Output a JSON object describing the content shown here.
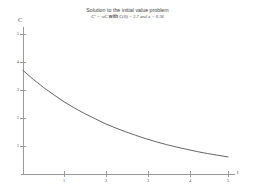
{
  "title": {
    "line1": "Solution to the initial value problem",
    "line2_math_pre": "C' = -aC",
    "line2_with": "with",
    "line2_math_post": "C(0) = 3.7 and a = 0.36"
  },
  "chart_data": {
    "type": "line",
    "title": "Solution to the initial value problem",
    "subtitle": "C' = -aC with C(0) = 3.7 and a = 0.36",
    "xlabel": "t",
    "ylabel": "C",
    "xlim": [
      0,
      5.2
    ],
    "ylim": [
      0,
      5
    ],
    "grid": false,
    "legend": "none",
    "xticks": [
      1,
      2,
      3,
      4,
      5
    ],
    "xtick_labels": [
      "1",
      "2",
      "3",
      "4",
      "5"
    ],
    "yticks": [
      1,
      2,
      3,
      4,
      5
    ],
    "ytick_labels": [
      "1",
      "2",
      "3",
      "4",
      "5"
    ],
    "series": [
      {
        "name": "C(t) = 3.7 e^(-0.36 t)",
        "color": "#555555",
        "x": [
          0,
          0.25,
          0.5,
          0.75,
          1,
          1.25,
          1.5,
          1.75,
          2,
          2.25,
          2.5,
          2.75,
          3,
          3.25,
          3.5,
          3.75,
          4,
          4.25,
          4.5,
          4.75,
          5
        ],
        "y": [
          3.7,
          3.38,
          3.09,
          2.83,
          2.58,
          2.36,
          2.16,
          1.98,
          1.8,
          1.65,
          1.51,
          1.38,
          1.26,
          1.15,
          1.05,
          0.96,
          0.88,
          0.8,
          0.73,
          0.67,
          0.61
        ]
      }
    ]
  }
}
